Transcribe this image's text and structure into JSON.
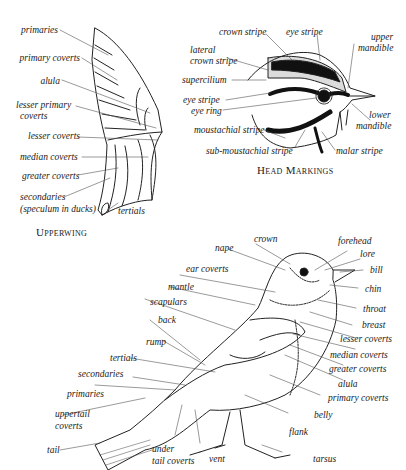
{
  "upperwing": {
    "caption": "Upperwing",
    "labels": {
      "primaries": "primaries",
      "primary_coverts": "primary coverts",
      "alula": "alula",
      "lesser_primary_coverts_1": "lesser primary",
      "lesser_primary_coverts_2": "coverts",
      "lesser_coverts": "lesser coverts",
      "median_coverts": "median coverts",
      "greater_coverts": "greater coverts",
      "secondaries_1": "secondaries",
      "secondaries_2": "(speculum in ducks)",
      "tertials": "tertials"
    }
  },
  "head": {
    "caption": "Head Markings",
    "labels": {
      "crown_stripe": "crown stripe",
      "eye_stripe_top": "eye stripe",
      "upper_mandible_1": "upper",
      "upper_mandible_2": "mandible",
      "lateral_crown_stripe_1": "lateral",
      "lateral_crown_stripe_2": "crown stripe",
      "supercilium": "supercilium",
      "eye_stripe": "eye stripe",
      "eye_ring": "eye ring",
      "moustachial_stripe": "moustachial stripe",
      "sub_moustachial_stripe": "sub-moustachial stripe",
      "malar_stripe": "malar stripe",
      "lower_mandible_1": "lower",
      "lower_mandible_2": "mandible"
    }
  },
  "body": {
    "labels": {
      "crown": "crown",
      "forehead": "forehead",
      "lore": "lore",
      "bill": "bill",
      "nape": "nape",
      "ear_coverts": "ear coverts",
      "chin": "chin",
      "mantle": "mantle",
      "throat": "throat",
      "scapulars": "scapulars",
      "breast": "breast",
      "back": "back",
      "lesser_coverts": "lesser coverts",
      "rump": "rump",
      "median_coverts": "median coverts",
      "tertials": "tertials",
      "greater_coverts": "greater coverts",
      "secondaries": "secondaries",
      "alula": "alula",
      "primaries": "primaries",
      "primary_coverts": "primary coverts",
      "uppertail_coverts_1": "uppertail",
      "uppertail_coverts_2": "coverts",
      "belly": "belly",
      "flank": "flank",
      "tail": "tail",
      "undertail_coverts_1": "under",
      "undertail_coverts_2": "tail coverts",
      "vent": "vent",
      "tarsus": "tarsus"
    }
  }
}
